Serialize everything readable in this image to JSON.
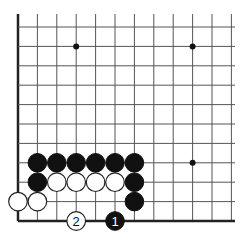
{
  "diagram": {
    "grid": {
      "origin_x": 18,
      "origin_y": 27,
      "spacing": 19.4,
      "cols": 12,
      "rows": 11,
      "right_end_x": 235,
      "top_end_y": 14,
      "edges": [
        "left",
        "bottom"
      ]
    },
    "star_points": [
      {
        "col": 3,
        "row": 1
      },
      {
        "col": 9,
        "row": 1
      },
      {
        "col": 9,
        "row": 7
      }
    ],
    "stones": [
      {
        "color": "black",
        "col": 1,
        "row": 7
      },
      {
        "color": "black",
        "col": 2,
        "row": 7
      },
      {
        "color": "black",
        "col": 3,
        "row": 7
      },
      {
        "color": "black",
        "col": 4,
        "row": 7
      },
      {
        "color": "black",
        "col": 5,
        "row": 7
      },
      {
        "color": "black",
        "col": 6,
        "row": 7
      },
      {
        "color": "black",
        "col": 1,
        "row": 8
      },
      {
        "color": "white",
        "col": 2,
        "row": 8
      },
      {
        "color": "white",
        "col": 3,
        "row": 8
      },
      {
        "color": "white",
        "col": 4,
        "row": 8
      },
      {
        "color": "white",
        "col": 5,
        "row": 8
      },
      {
        "color": "black",
        "col": 6,
        "row": 8
      },
      {
        "color": "white",
        "col": 0,
        "row": 9
      },
      {
        "color": "white",
        "col": 1,
        "row": 9
      },
      {
        "color": "black",
        "col": 6,
        "row": 9
      }
    ],
    "moves": [
      {
        "number": "1",
        "color": "black",
        "col": 5,
        "row": 10
      },
      {
        "number": "2",
        "color": "white",
        "col": 3,
        "row": 10
      }
    ]
  }
}
